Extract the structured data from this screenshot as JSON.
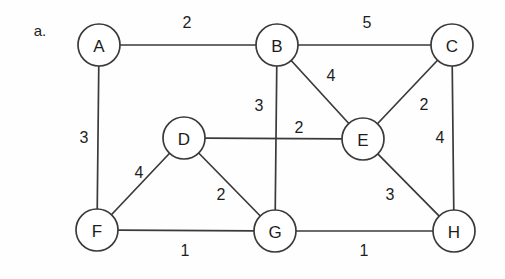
{
  "figure": {
    "marker_label": "a.",
    "marker_x": 40,
    "marker_y": 30,
    "background_color": "#fefefe",
    "stroke_color": "#3a3a3a",
    "text_color": "#1d1d1d"
  },
  "chart_data": {
    "type": "diagram",
    "subtype": "weighted-undirected-graph",
    "title": "a.",
    "nodes": [
      {
        "id": "A",
        "label": "A",
        "x": 99,
        "y": 45,
        "r": 21
      },
      {
        "id": "B",
        "label": "B",
        "x": 277,
        "y": 45,
        "r": 21
      },
      {
        "id": "C",
        "label": "C",
        "x": 452,
        "y": 45,
        "r": 21
      },
      {
        "id": "D",
        "label": "D",
        "x": 184,
        "y": 138,
        "r": 21
      },
      {
        "id": "E",
        "label": "E",
        "x": 363,
        "y": 139,
        "r": 21
      },
      {
        "id": "F",
        "label": "F",
        "x": 97,
        "y": 230,
        "r": 21
      },
      {
        "id": "G",
        "label": "G",
        "x": 275,
        "y": 231,
        "r": 21
      },
      {
        "id": "H",
        "label": "H",
        "x": 454,
        "y": 231,
        "r": 21
      }
    ],
    "edges": [
      {
        "from": "A",
        "to": "B",
        "weight": "2",
        "label_x": 187,
        "label_y": 22
      },
      {
        "from": "B",
        "to": "C",
        "weight": "5",
        "label_x": 367,
        "label_y": 22
      },
      {
        "from": "A",
        "to": "F",
        "weight": "3",
        "label_x": 84,
        "label_y": 137
      },
      {
        "from": "B",
        "to": "E",
        "weight": "4",
        "label_x": 331,
        "label_y": 75
      },
      {
        "from": "B",
        "to": "G",
        "weight": "3",
        "label_x": 259,
        "label_y": 105
      },
      {
        "from": "C",
        "to": "E",
        "weight": "2",
        "label_x": 424,
        "label_y": 104
      },
      {
        "from": "C",
        "to": "H",
        "weight": "4",
        "label_x": 440,
        "label_y": 137
      },
      {
        "from": "D",
        "to": "E",
        "weight": "2",
        "label_x": 299,
        "label_y": 127
      },
      {
        "from": "D",
        "to": "F",
        "weight": "4",
        "label_x": 139,
        "label_y": 172
      },
      {
        "from": "D",
        "to": "G",
        "weight": "2",
        "label_x": 221,
        "label_y": 194
      },
      {
        "from": "E",
        "to": "H",
        "weight": "3",
        "label_x": 390,
        "label_y": 194
      },
      {
        "from": "F",
        "to": "G",
        "weight": "1",
        "label_x": 185,
        "label_y": 250
      },
      {
        "from": "G",
        "to": "H",
        "weight": "1",
        "label_x": 364,
        "label_y": 250
      }
    ]
  }
}
